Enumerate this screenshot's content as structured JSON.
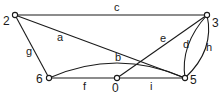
{
  "diagram": {
    "type": "graph",
    "nodes": [
      {
        "id": "2",
        "label": "2",
        "x": 15,
        "y": 15,
        "lx": 3,
        "ly": 25
      },
      {
        "id": "3",
        "label": "3",
        "x": 207,
        "y": 15,
        "lx": 212,
        "ly": 27
      },
      {
        "id": "6",
        "label": "6",
        "x": 49,
        "y": 78,
        "lx": 36,
        "ly": 83
      },
      {
        "id": "0",
        "label": "0",
        "x": 117,
        "y": 78,
        "lx": 112,
        "ly": 92
      },
      {
        "id": "5",
        "label": "5",
        "x": 185,
        "y": 78,
        "lx": 190,
        "ly": 84
      }
    ],
    "edges": [
      {
        "id": "a",
        "label": "a",
        "from": "2",
        "to": "5",
        "d": "M15,15 L185,78",
        "lx": 57,
        "ly": 41
      },
      {
        "id": "b",
        "label": "b",
        "from": "6",
        "to": "5",
        "d": "M49,78 Q117,48 185,78",
        "lx": 115,
        "ly": 61
      },
      {
        "id": "c",
        "label": "c",
        "from": "2",
        "to": "3",
        "d": "M15,15 L207,15",
        "lx": 114,
        "ly": 11
      },
      {
        "id": "d",
        "label": "d",
        "from": "3",
        "to": "5",
        "d": "M207,15 Q180,45 185,78",
        "lx": 183,
        "ly": 48
      },
      {
        "id": "e",
        "label": "e",
        "from": "0",
        "to": "3",
        "d": "M117,78 L207,15",
        "lx": 160,
        "ly": 42
      },
      {
        "id": "f",
        "label": "f",
        "from": "6",
        "to": "0",
        "d": "M49,78 L117,78",
        "lx": 83,
        "ly": 90
      },
      {
        "id": "g",
        "label": "g",
        "from": "2",
        "to": "6",
        "d": "M15,15 L49,78",
        "lx": 26,
        "ly": 55
      },
      {
        "id": "h",
        "label": "h",
        "from": "3",
        "to": "5",
        "d": "M207,15 Q215,50 185,78",
        "lx": 206,
        "ly": 51
      },
      {
        "id": "i",
        "label": "i",
        "from": "0",
        "to": "5",
        "d": "M117,78 L185,78",
        "lx": 150,
        "ly": 90
      }
    ]
  }
}
